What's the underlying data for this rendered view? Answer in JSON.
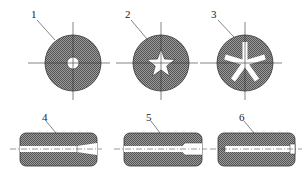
{
  "diagram": {
    "type": "technical-drawing",
    "colors": {
      "fill": "#8a8a8a",
      "stroke": "#333333",
      "hole": "#ffffff"
    },
    "cross_sections": [
      {
        "label": "1",
        "shape": "circle-hole"
      },
      {
        "label": "2",
        "shape": "star"
      },
      {
        "label": "3",
        "shape": "five-spoke"
      }
    ],
    "longitudinal_sections": [
      {
        "label": "4",
        "shape": "tapered-bore"
      },
      {
        "label": "5",
        "shape": "stepped-bore"
      },
      {
        "label": "6",
        "shape": "straight-bore-with-recess"
      }
    ]
  }
}
